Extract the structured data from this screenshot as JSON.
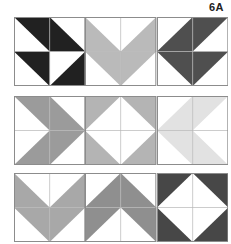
{
  "page": {
    "label": "6A",
    "background": "#ffffff"
  },
  "diagram": {
    "grid_line_color": "#b5b5b5",
    "block_border_color": "#8c8c8c",
    "white_patch_color": "#ffffff",
    "quad_order": [
      "top-left",
      "top-right",
      "bottom-left",
      "bottom-right"
    ],
    "orientation_legend": "Value = which half of the square is colored: NE, NW, SE, SW",
    "rows": [
      {
        "name": "row-1",
        "blocks": [
          {
            "name": "block-1-1",
            "motif": "diagonal-band-pinwheel",
            "color": "#212121",
            "quads": [
              "NE",
              "SW",
              "NE",
              "SE"
            ]
          },
          {
            "name": "block-1-2",
            "motif": "arrow-down-chevron",
            "color": "#bababa",
            "quads": [
              "SW",
              "SE",
              "NE",
              "NW"
            ]
          },
          {
            "name": "block-1-3",
            "motif": "band-and-down-triangle",
            "color": "#4f4f4f",
            "quads": [
              "SE",
              "NW",
              "NE",
              "NW"
            ]
          }
        ]
      },
      {
        "name": "row-2",
        "blocks": [
          {
            "name": "block-2-1",
            "motif": "arrow-right-chevron",
            "color": "#9b9b9b",
            "quads": [
              "NE",
              "SW",
              "SE",
              "NW"
            ]
          },
          {
            "name": "block-2-2",
            "motif": "white-diamond-corners",
            "color": "#b4b4b4",
            "quads": [
              "NW",
              "NE",
              "SW",
              "SE"
            ]
          },
          {
            "name": "block-2-3",
            "motif": "arrow-left-chevron",
            "color": "#e2e2e2",
            "quads": [
              "SE",
              "NW",
              "NE",
              "SW"
            ]
          }
        ]
      },
      {
        "name": "row-3",
        "blocks": [
          {
            "name": "block-3-1",
            "motif": "arrow-down-chevron",
            "color": "#a8a8a8",
            "quads": [
              "SW",
              "SE",
              "NE",
              "NW"
            ]
          },
          {
            "name": "block-3-2",
            "motif": "arrow-up-chevron",
            "color": "#8f8f8f",
            "quads": [
              "SE",
              "SW",
              "NW",
              "NE"
            ]
          },
          {
            "name": "block-3-3",
            "motif": "white-diamond-corners",
            "color": "#474747",
            "quads": [
              "NW",
              "NE",
              "SW",
              "SE"
            ]
          }
        ]
      }
    ]
  }
}
